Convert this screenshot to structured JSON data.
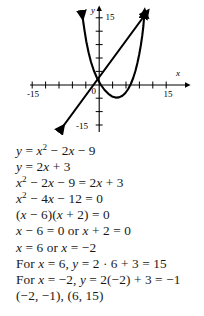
{
  "graph": {
    "axes": {
      "x_name": "x",
      "y_name": "y",
      "x_max_label": "15",
      "x_min_label": "-15",
      "y_max_label": "15",
      "y_min_label": "-15",
      "origin_label": "0",
      "x_range": [
        -15,
        15
      ],
      "y_range": [
        -15,
        15
      ],
      "tick_step": 3,
      "grid": false
    },
    "curves": [
      {
        "name": "parabola",
        "equation": "y = x^2 - 2x - 9",
        "type": "quadratic",
        "a": 1,
        "b": -2,
        "c": -9,
        "vertex": [
          1,
          -10
        ],
        "color": "#000000"
      },
      {
        "name": "line",
        "equation": "y = 2x + 3",
        "type": "linear",
        "slope": 2,
        "intercept": 3,
        "color": "#000000"
      }
    ],
    "intersections": [
      [
        -2,
        -1
      ],
      [
        6,
        15
      ]
    ]
  },
  "chart_data": {
    "type": "line",
    "title": "",
    "xlabel": "x",
    "ylabel": "y",
    "xlim": [
      -15,
      15
    ],
    "ylim": [
      -15,
      15
    ],
    "tick_step": 3,
    "grid": false,
    "series": [
      {
        "name": "y = x^2 - 2x - 9",
        "x": [
          -3,
          -2,
          -1,
          0,
          1,
          2,
          3,
          4,
          5,
          6
        ],
        "values": [
          6,
          -1,
          -6,
          -9,
          -10,
          -9,
          -6,
          -1,
          6,
          15
        ]
      },
      {
        "name": "y = 2x + 3",
        "x": [
          -9,
          -6,
          -3,
          -2,
          0,
          2,
          4,
          6
        ],
        "values": [
          -15,
          -9,
          -3,
          -1,
          3,
          7,
          11,
          15
        ]
      }
    ],
    "annotations": [
      "intersection (-2, -1)",
      "intersection (6, 15)"
    ]
  },
  "solution": {
    "lines": [
      {
        "id": "line-1",
        "html": "<i>y</i> = <i>x</i><sup>2</sup> &#8722; 2<i>x</i> &#8722; 9"
      },
      {
        "id": "line-2",
        "html": "<i>y</i> = 2<i>x</i> + 3"
      },
      {
        "id": "line-3",
        "html": "<i>x</i><sup>2</sup> &#8722; 2<i>x</i> &#8722; 9 = 2<i>x</i> + 3"
      },
      {
        "id": "line-4",
        "html": "<i>x</i><sup>2</sup> &#8722; 4<i>x</i> &#8722; 12 = 0"
      },
      {
        "id": "line-5",
        "html": "(<i>x</i> &#8722; 6)(<i>x</i> + 2) = 0"
      },
      {
        "id": "line-6",
        "html": "<i>x</i> &#8722; 6 = 0 or <i>x</i> + 2 = 0"
      },
      {
        "id": "line-7",
        "html": "<i>x</i> = 6 or <i>x</i> = &#8722;2"
      },
      {
        "id": "line-8",
        "html": "For <i>x</i> = 6, <i>y</i> = 2 &#183; 6 + 3 = 15"
      },
      {
        "id": "line-9",
        "html": "For <i>x</i> = &#8722;2, <i>y</i> = 2(&#8722;2) + 3 = &#8722;1"
      },
      {
        "id": "line-10",
        "html": "(&#8722;2, &#8722;1), (6, 15)"
      }
    ]
  }
}
